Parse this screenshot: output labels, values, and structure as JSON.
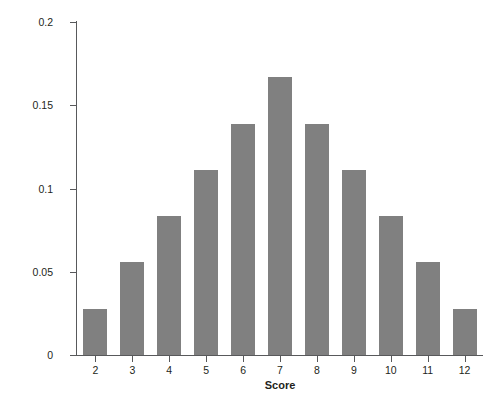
{
  "chart_data": {
    "type": "bar",
    "title": "",
    "xlabel": "Score",
    "ylabel": "Probability",
    "categories": [
      "2",
      "3",
      "4",
      "5",
      "6",
      "7",
      "8",
      "9",
      "10",
      "11",
      "12"
    ],
    "values": [
      0.0278,
      0.0556,
      0.0833,
      0.1111,
      0.1389,
      0.1667,
      0.1389,
      0.1111,
      0.0833,
      0.0556,
      0.0278
    ],
    "ylim": [
      0,
      0.2
    ],
    "xlim": [
      1.5,
      12.5
    ],
    "ytick_labels": [
      "0",
      "0.05",
      "0.1",
      "0.15",
      "0.2"
    ],
    "ytick_values": [
      0,
      0.05,
      0.1,
      0.15,
      0.2
    ],
    "xtick_labels": [
      "2",
      "3",
      "4",
      "5",
      "6",
      "7",
      "8",
      "9",
      "10",
      "11",
      "12"
    ],
    "grid": false,
    "legend": false,
    "bar_color": "#808080",
    "axis_color": "#58595b",
    "text_color": "#231f20",
    "background": "#ffffff"
  }
}
